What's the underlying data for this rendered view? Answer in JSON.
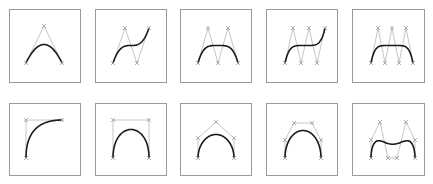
{
  "figure": {
    "colors": {
      "box_border": "#9a9a9a",
      "control_polygon": "#b8b8b8",
      "curve": "#1a1a1a",
      "control_marker": "#9c9c9c"
    },
    "panels": [
      {
        "id": "r1c1",
        "box": [
          9,
          9,
          71,
          73
        ],
        "points": [
          [
            26,
            63
          ],
          [
            44,
            26
          ],
          [
            62,
            63
          ]
        ]
      },
      {
        "id": "r1c2",
        "box": [
          95,
          9,
          71,
          73
        ],
        "points": [
          [
            113,
            63
          ],
          [
            125,
            28
          ],
          [
            137,
            63
          ],
          [
            149,
            28
          ]
        ]
      },
      {
        "id": "r1c3",
        "box": [
          180,
          9,
          71,
          73
        ],
        "points": [
          [
            198,
            63
          ],
          [
            208,
            28
          ],
          [
            218,
            63
          ],
          [
            228,
            28
          ],
          [
            238,
            63
          ]
        ]
      },
      {
        "id": "r1c4",
        "box": [
          266,
          9,
          71,
          73
        ],
        "points": [
          [
            285,
            63
          ],
          [
            293,
            28
          ],
          [
            301,
            63
          ],
          [
            309,
            28
          ],
          [
            317,
            63
          ],
          [
            325,
            28
          ]
        ]
      },
      {
        "id": "r1c5",
        "box": [
          352,
          9,
          72,
          73
        ],
        "points": [
          [
            371,
            63
          ],
          [
            378,
            28
          ],
          [
            385,
            63
          ],
          [
            392,
            28
          ],
          [
            399,
            63
          ],
          [
            406,
            28
          ],
          [
            413,
            63
          ]
        ]
      },
      {
        "id": "r2c1",
        "box": [
          9,
          103,
          71,
          72
        ],
        "points": [
          [
            26,
            158
          ],
          [
            26,
            120
          ],
          [
            62,
            120
          ]
        ]
      },
      {
        "id": "r2c2",
        "box": [
          95,
          103,
          71,
          72
        ],
        "points": [
          [
            113,
            158
          ],
          [
            113,
            120
          ],
          [
            149,
            120
          ],
          [
            149,
            158
          ]
        ]
      },
      {
        "id": "r2c3",
        "box": [
          180,
          103,
          71,
          72
        ],
        "points": [
          [
            198,
            158
          ],
          [
            198,
            138
          ],
          [
            216,
            122
          ],
          [
            234,
            138
          ],
          [
            234,
            158
          ]
        ]
      },
      {
        "id": "r2c4",
        "box": [
          266,
          103,
          71,
          72
        ],
        "points": [
          [
            285,
            158
          ],
          [
            285,
            140
          ],
          [
            294,
            123
          ],
          [
            312,
            123
          ],
          [
            321,
            140
          ],
          [
            321,
            158
          ]
        ]
      },
      {
        "id": "r2c5",
        "box": [
          352,
          103,
          72,
          72
        ],
        "points": [
          [
            371,
            158
          ],
          [
            371,
            140
          ],
          [
            380,
            122
          ],
          [
            388,
            158
          ],
          [
            397,
            158
          ],
          [
            406,
            122
          ],
          [
            415,
            140
          ],
          [
            415,
            158
          ]
        ]
      }
    ]
  }
}
